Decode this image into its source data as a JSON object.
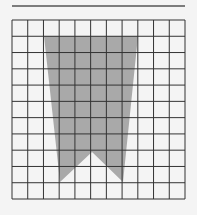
{
  "diagram": {
    "grid": {
      "cols": 11,
      "rows": 11,
      "left": 12,
      "top": 20,
      "right": 185,
      "bottom": 199,
      "line_color": "#333333"
    },
    "top_rule": {
      "x1": 12,
      "x2": 185,
      "y": 6,
      "color": "#555555"
    },
    "shape": {
      "fill": "#a9a9a9",
      "points": [
        [
          44,
          36
        ],
        [
          138,
          36
        ],
        [
          123,
          182
        ],
        [
          92,
          152
        ],
        [
          60,
          182
        ]
      ]
    },
    "background": "#f4f4f4"
  }
}
